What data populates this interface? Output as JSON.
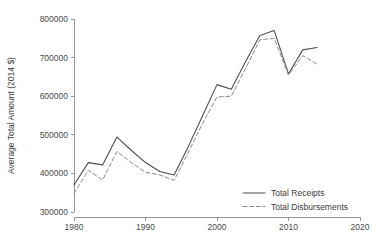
{
  "chart_data": {
    "type": "line",
    "title": "",
    "subtitle": "",
    "xlabel": "",
    "ylabel": "Average Total Amount (2014 $)",
    "xlim": [
      1980,
      2020
    ],
    "ylim": [
      300000,
      800000
    ],
    "grid": false,
    "legend_position": "bottom-right",
    "x_ticks": [
      "1980",
      "1990",
      "2000",
      "2010",
      "2020"
    ],
    "x_tick_values": [
      1980,
      1990,
      2000,
      2010,
      2020
    ],
    "y_ticks": [
      "300000",
      "400000",
      "500000",
      "600000",
      "700000",
      "800000"
    ],
    "y_tick_values": [
      300000,
      400000,
      500000,
      600000,
      700000,
      800000
    ],
    "x": [
      1980,
      1982,
      1984,
      1986,
      1988,
      1990,
      1992,
      1994,
      1996,
      1998,
      2000,
      2002,
      2004,
      2006,
      2008,
      2010,
      2012,
      2014
    ],
    "series": [
      {
        "name": "Total Receipts",
        "style": "solid",
        "color": "#4d4d4d",
        "values": [
          370000,
          428000,
          422000,
          494000,
          460000,
          428000,
          405000,
          396000,
          470000,
          550000,
          630000,
          618000,
          690000,
          757000,
          770000,
          658000,
          720000,
          726000
        ]
      },
      {
        "name": "Total Disbursements",
        "style": "dashed",
        "color": "#8a8a8a",
        "values": [
          348000,
          408000,
          383000,
          457000,
          428000,
          403000,
          396000,
          382000,
          455000,
          530000,
          598000,
          600000,
          672000,
          746000,
          750000,
          655000,
          705000,
          683000
        ]
      }
    ]
  },
  "legend": {
    "items": [
      {
        "label": "Total Receipts",
        "style": "solid"
      },
      {
        "label": "Total Disbursements",
        "style": "dashed"
      }
    ]
  },
  "colors": {
    "background": "#ffffff",
    "axis": "#8c8c8c",
    "text": "#3a3a3a",
    "receipts": "#4d4d4d",
    "disbursements": "#8a8a8a"
  }
}
